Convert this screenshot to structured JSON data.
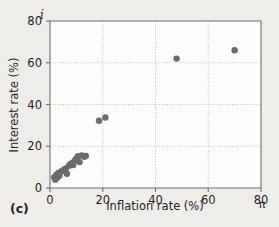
{
  "panel": {
    "label": "(c)"
  },
  "axis_symbols": {
    "y_symbol": "i",
    "x_symbol": "π"
  },
  "chart_data": {
    "type": "scatter",
    "title": "",
    "xlabel": "Inflation rate (%)",
    "ylabel": "Interest rate (%)",
    "xlim": [
      0,
      80
    ],
    "ylim": [
      0,
      80
    ],
    "xticks": [
      0,
      20,
      40,
      60,
      80
    ],
    "yticks": [
      0,
      20,
      40,
      60,
      80
    ],
    "xticklabels": [
      "0",
      "20",
      "40",
      "60",
      "80"
    ],
    "yticklabels": [
      "0",
      "20",
      "40",
      "60",
      "80"
    ],
    "grid": true,
    "grid_style": "dotted",
    "legend": "none",
    "marker": "circle",
    "marker_color": "#6b6b6b",
    "marker_size": 3.2,
    "points": [
      {
        "x": 1.6,
        "y": 5.2
      },
      {
        "x": 2.0,
        "y": 4.0
      },
      {
        "x": 2.4,
        "y": 6.4
      },
      {
        "x": 2.8,
        "y": 5.0
      },
      {
        "x": 3.2,
        "y": 7.2
      },
      {
        "x": 3.6,
        "y": 6.0
      },
      {
        "x": 4.4,
        "y": 8.0
      },
      {
        "x": 5.2,
        "y": 8.6
      },
      {
        "x": 6.0,
        "y": 9.4
      },
      {
        "x": 6.4,
        "y": 6.8
      },
      {
        "x": 7.2,
        "y": 10.6
      },
      {
        "x": 7.6,
        "y": 11.4
      },
      {
        "x": 8.4,
        "y": 12.0
      },
      {
        "x": 8.8,
        "y": 11.0
      },
      {
        "x": 9.4,
        "y": 13.2
      },
      {
        "x": 10.0,
        "y": 14.0
      },
      {
        "x": 10.6,
        "y": 15.2
      },
      {
        "x": 11.2,
        "y": 12.4
      },
      {
        "x": 12.0,
        "y": 15.6
      },
      {
        "x": 13.0,
        "y": 15.0
      },
      {
        "x": 13.6,
        "y": 15.4
      },
      {
        "x": 18.6,
        "y": 32.2
      },
      {
        "x": 21.0,
        "y": 33.8
      },
      {
        "x": 48.0,
        "y": 62.0
      },
      {
        "x": 70.0,
        "y": 66.0
      }
    ]
  }
}
